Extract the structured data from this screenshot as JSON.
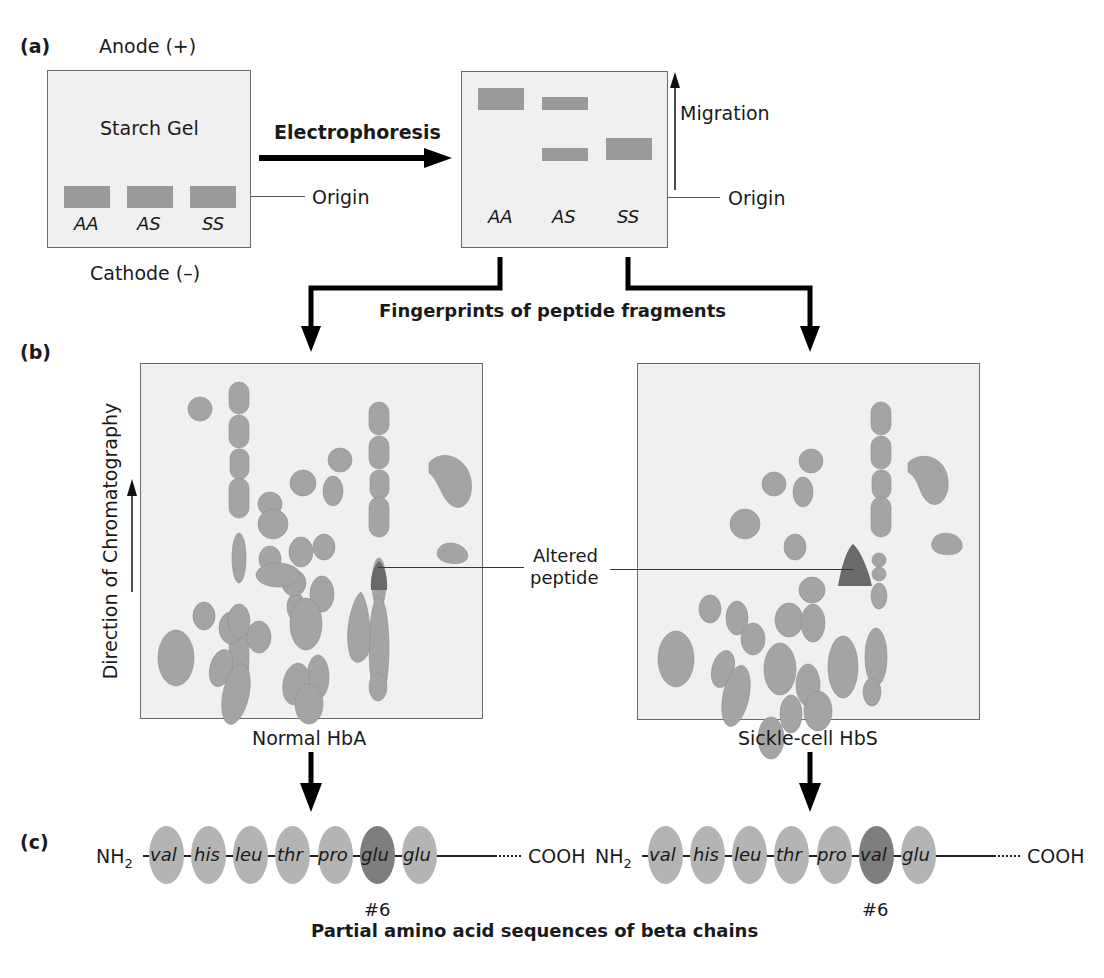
{
  "figure": {
    "part_a": {
      "label": "(a)",
      "anode_label": "Anode (+)",
      "cathode_label": "Cathode (–)",
      "gel_title": "Starch Gel",
      "process_label": "Electrophoresis",
      "origin_label_left": "Origin",
      "origin_label_right": "Origin",
      "migration_label": "Migration",
      "lanes_before": [
        "AA",
        "AS",
        "SS"
      ],
      "lanes_after": [
        "AA",
        "AS",
        "SS"
      ]
    },
    "part_b": {
      "label": "(b)",
      "heading": "Fingerprints of peptide fragments",
      "axis_label": "Direction of Chromatography",
      "callout_line1": "Altered",
      "callout_line2": "peptide",
      "left_caption": "Normal HbA",
      "right_caption": "Sickle-cell HbS"
    },
    "part_c": {
      "label": "(c)",
      "caption": "Partial amino acid sequences of beta chains",
      "n_terminus": "NH",
      "n_sub": "2",
      "c_terminus": "COOH",
      "position_label": "#6",
      "normal_sequence": [
        "val",
        "his",
        "leu",
        "thr",
        "pro",
        "glu",
        "glu"
      ],
      "sickle_sequence": [
        "val",
        "his",
        "leu",
        "thr",
        "pro",
        "val",
        "glu"
      ],
      "mutated_index": 5
    },
    "colors": {
      "gel_bg": "#f0f0f0",
      "band": "#9a9a9a",
      "spot": "#a4a4a4",
      "altered_spot": "#6a6a6a",
      "residue": "#b4b4b4",
      "mutated_residue": "#7e7e7e"
    }
  }
}
